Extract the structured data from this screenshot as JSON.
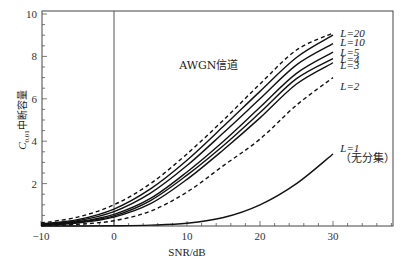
{
  "chart_data": {
    "type": "line",
    "title": "",
    "xlabel": "SNR/dB",
    "ylabel": "C_out,中断容量",
    "ylabel_main": "C",
    "ylabel_sub": "0.01",
    "ylabel_cn": "中断容量",
    "xlim": [
      -10,
      38
    ],
    "ylim": [
      0,
      10.2
    ],
    "xticks": [
      -10,
      0,
      10,
      20,
      30
    ],
    "yticks": [
      2,
      4,
      6,
      8,
      10
    ],
    "grid": false,
    "vertical_reference_line_x": 0,
    "x": [
      -10,
      -5,
      0,
      5,
      10,
      15,
      20,
      25,
      30
    ],
    "series": [
      {
        "name": "AWGN信道",
        "style": "dashed",
        "values": [
          0.14,
          0.42,
          1.0,
          2.0,
          3.4,
          5.0,
          6.7,
          8.3,
          9.1
        ]
      },
      {
        "name": "L=20",
        "style": "solid",
        "values": [
          0.1,
          0.3,
          0.8,
          1.75,
          3.1,
          4.7,
          6.35,
          7.95,
          9.0
        ]
      },
      {
        "name": "L=10",
        "style": "solid",
        "values": [
          0.08,
          0.25,
          0.68,
          1.55,
          2.85,
          4.4,
          6.0,
          7.6,
          8.6
        ]
      },
      {
        "name": "L=5",
        "style": "solid",
        "values": [
          0.06,
          0.2,
          0.55,
          1.3,
          2.55,
          4.0,
          5.6,
          7.2,
          8.2
        ]
      },
      {
        "name": "L=4",
        "style": "solid",
        "values": [
          0.05,
          0.17,
          0.48,
          1.2,
          2.4,
          3.8,
          5.35,
          6.95,
          7.9
        ]
      },
      {
        "name": "L=3",
        "style": "solid",
        "values": [
          0.04,
          0.14,
          0.42,
          1.05,
          2.2,
          3.6,
          5.1,
          6.7,
          7.7
        ]
      },
      {
        "name": "L=2",
        "style": "dashed",
        "values": [
          0.02,
          0.08,
          0.25,
          0.7,
          1.6,
          2.85,
          4.1,
          5.7,
          7.0
        ]
      },
      {
        "name": "L=1（无分集）",
        "style": "solid",
        "values": [
          0.0,
          0.0,
          0.01,
          0.04,
          0.13,
          0.4,
          1.0,
          2.0,
          3.4
        ]
      }
    ],
    "annotations": [
      {
        "text": "AWGN信道",
        "x": 13,
        "y": 7.6
      },
      {
        "text": "L=20",
        "x": 31,
        "y": 9.1
      },
      {
        "text": "L=10",
        "x": 31,
        "y": 8.7
      },
      {
        "text": "L=5",
        "x": 31,
        "y": 8.2
      },
      {
        "text": "L=4",
        "x": 31,
        "y": 7.9
      },
      {
        "text": "L=3",
        "x": 31,
        "y": 7.6
      },
      {
        "text": "L=2",
        "x": 31,
        "y": 6.6
      },
      {
        "text": "L=1",
        "x": 31,
        "y": 3.7
      },
      {
        "text": "（无分集）",
        "x": 31,
        "y": 3.2
      }
    ],
    "legend": "none (inline labels)"
  }
}
